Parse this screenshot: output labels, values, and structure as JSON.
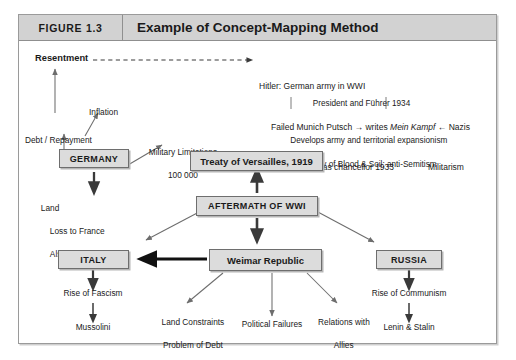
{
  "figure": {
    "number": "FIGURE 1.3",
    "title": "Example of Concept-Mapping Method"
  },
  "nodes": {
    "germany": "GERMANY",
    "treaty": "Treaty of Versailles, 1919",
    "aftermath": "AFTERMATH OF WWI",
    "italy": "ITALY",
    "weimar": "Weimar Republic",
    "russia": "RUSSIA"
  },
  "labels": {
    "resentment": "Resentment",
    "inflation": "Inflation",
    "debt_repayment": "Debt / Repayment",
    "military_limitations_l1": "Military Limitations",
    "military_limitations_l2": "100 000",
    "land_l1": "Land",
    "land_l2": "Loss to France",
    "land_l3": "Alsace-Lorraine",
    "rise_of_fascism": "Rise of Fascism",
    "mussolini": "Mussolini",
    "land_constraints_l1": "Land Constraints",
    "land_constraints_l2": "Problem of Debt",
    "political_failures": "Political Failures",
    "relations_l1": "Relations with",
    "relations_l2": "Allies",
    "rise_of_communism": "Rise of Communism",
    "lenin_stalin": "Lenin & Stalin"
  },
  "hitler_block": {
    "line1": "Hitler: German army in WWI",
    "line2_a": "Failed Munich Putsch → writes ",
    "line2_italic": "Mein Kampf",
    "line2_b": " ← Nazis",
    "line3_a": "Succeeds as chancellor 1933",
    "line3_b": "Militarism",
    "line4": "President and Führer 1934",
    "line5": "Develops army and territorial expansionism",
    "line6": "Theory of Blood & Soil; anti-Semitism"
  },
  "colors": {
    "node_fill": "#dcdcdc",
    "node_border": "#6e6e6e",
    "header_band": "#d2d2d2",
    "frame_border": "#9a9a9a",
    "thin_arrow": "#6d6d6d",
    "thick_arrow": "#3a3a3a",
    "bold_arrow": "#111111"
  }
}
